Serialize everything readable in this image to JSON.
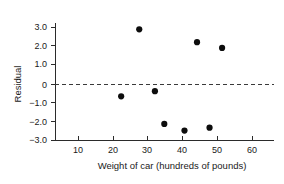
{
  "chart_data": {
    "type": "scatter",
    "title": "",
    "xlabel": "Weight of car  (hundreds of pounds)",
    "ylabel": "Residual",
    "xlim": [
      4.5,
      66
    ],
    "ylim": [
      -3.0,
      3.2
    ],
    "grid": false,
    "legend": null,
    "xticks": [
      10,
      20,
      30,
      40,
      50,
      60
    ],
    "xtick_labels": [
      "10",
      "20",
      "30",
      "40",
      "50",
      "60"
    ],
    "yticks": [
      3.0,
      2.0,
      1.0,
      0,
      -1.0,
      -2.0,
      -3.0
    ],
    "ytick_labels": [
      "3.0",
      "2.0",
      "1.0",
      "0",
      "−1.0",
      "−2.0",
      "−3.0"
    ],
    "reference_line": {
      "type": "horizontal-dashed",
      "y": 0,
      "label": ""
    },
    "points": [
      {
        "x": 22.4,
        "y": -0.65
      },
      {
        "x": 27.6,
        "y": 2.88
      },
      {
        "x": 32.1,
        "y": -0.38
      },
      {
        "x": 34.8,
        "y": -2.1
      },
      {
        "x": 40.6,
        "y": -2.45
      },
      {
        "x": 44.2,
        "y": 2.2
      },
      {
        "x": 47.8,
        "y": -2.3
      },
      {
        "x": 51.4,
        "y": 1.9
      }
    ],
    "marker": {
      "shape": "circle",
      "size_px": 3.1,
      "color": "#0d0d0d"
    },
    "colors": {
      "marker": "#0d0d0d",
      "axis": "#2b2b2b",
      "reference_line": "#3a3a3a",
      "text": "#1a1a1a",
      "background": "#ffffff"
    }
  }
}
